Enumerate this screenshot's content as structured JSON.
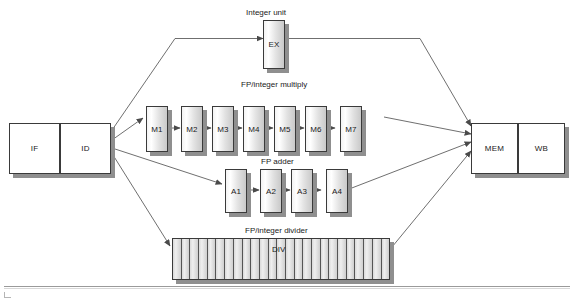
{
  "figure": {
    "captions": {
      "integer_unit": "Integer unit",
      "fp_multiply": "FP/integer multiply",
      "fp_adder": "FP adder",
      "fp_divider": "FP/integer divider"
    }
  },
  "front_end": {
    "stages": [
      {
        "id": "IF",
        "label": "IF"
      },
      {
        "id": "ID",
        "label": "ID"
      }
    ]
  },
  "back_end": {
    "stages": [
      {
        "id": "MEM",
        "label": "MEM"
      },
      {
        "id": "WB",
        "label": "WB"
      }
    ]
  },
  "integer_unit": {
    "stages": [
      {
        "id": "EX",
        "label": "EX"
      }
    ]
  },
  "fp_multiply": {
    "stages": [
      {
        "id": "M1",
        "label": "M1"
      },
      {
        "id": "M2",
        "label": "M2"
      },
      {
        "id": "M3",
        "label": "M3"
      },
      {
        "id": "M4",
        "label": "M4"
      },
      {
        "id": "M5",
        "label": "M5"
      },
      {
        "id": "M6",
        "label": "M6"
      },
      {
        "id": "M7",
        "label": "M7"
      }
    ]
  },
  "fp_adder": {
    "stages": [
      {
        "id": "A1",
        "label": "A1"
      },
      {
        "id": "A2",
        "label": "A2"
      },
      {
        "id": "A3",
        "label": "A3"
      },
      {
        "id": "A4",
        "label": "A4"
      }
    ]
  },
  "fp_divider": {
    "label": "DIV",
    "segment_count": 25
  },
  "colors": {
    "outline": "#3a3a3a",
    "shadow": "#8f8f8f",
    "wire": "#4a4a4a",
    "register_fill": "#ffffff",
    "stage_fill_light": "#f3f3f3",
    "stage_fill_dark": "#c9c9c9",
    "divider_fill": "#cfcfcf",
    "rule": "#9a9a9a"
  }
}
